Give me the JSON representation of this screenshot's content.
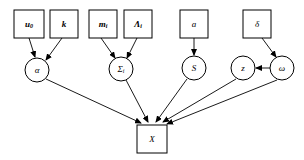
{
  "diagram": {
    "type": "directed-acyclic-graph",
    "background_color": "#ffffff",
    "stroke_color": "#000000",
    "node_fill": "#ffffff",
    "square_nodes": [
      {
        "id": "u0",
        "label": "u",
        "sub": "0",
        "bold": true,
        "x": 14,
        "y": 10,
        "w": 30,
        "h": 28
      },
      {
        "id": "k",
        "label": "k",
        "sub": "",
        "bold": true,
        "x": 50,
        "y": 10,
        "w": 28,
        "h": 28
      },
      {
        "id": "m_i",
        "label": "m",
        "sub": "i",
        "bold": true,
        "x": 89,
        "y": 10,
        "w": 28,
        "h": 28
      },
      {
        "id": "Lambda_i",
        "label": "Λ",
        "sub": "i",
        "bold": true,
        "x": 124,
        "y": 10,
        "w": 28,
        "h": 28
      },
      {
        "id": "a",
        "label": "a",
        "sub": "",
        "bold": false,
        "x": 180,
        "y": 10,
        "w": 28,
        "h": 28
      },
      {
        "id": "delta",
        "label": "δ",
        "sub": "",
        "bold": false,
        "x": 243,
        "y": 10,
        "w": 28,
        "h": 28
      },
      {
        "id": "X",
        "label": "X",
        "sub": "",
        "bold": false,
        "x": 137,
        "y": 125,
        "w": 30,
        "h": 28
      }
    ],
    "circle_nodes": [
      {
        "id": "alpha",
        "label": "α",
        "sub": "",
        "cx": 37,
        "cy": 70,
        "r": 12
      },
      {
        "id": "Sigma_i",
        "label": "Σ",
        "sub": "i",
        "cx": 121,
        "cy": 69,
        "r": 12
      },
      {
        "id": "S",
        "label": "S",
        "sub": "",
        "cx": 194,
        "cy": 68,
        "r": 12
      },
      {
        "id": "z",
        "label": "z",
        "sub": "",
        "cx": 243,
        "cy": 68,
        "r": 12
      },
      {
        "id": "omega",
        "label": "ω",
        "sub": "",
        "cx": 282,
        "cy": 68,
        "r": 12
      }
    ],
    "edges": [
      {
        "id": "u0-to-alpha",
        "from": "u0",
        "to": "alpha",
        "x1": 29,
        "y1": 38,
        "x2": 35,
        "y2": 57
      },
      {
        "id": "k-to-alpha",
        "from": "k",
        "to": "alpha",
        "x1": 62,
        "y1": 38,
        "x2": 46,
        "y2": 60
      },
      {
        "id": "mi-to-Sigma",
        "from": "m_i",
        "to": "Sigma_i",
        "x1": 101,
        "y1": 38,
        "x2": 115,
        "y2": 58
      },
      {
        "id": "Lambda-to-Sigma",
        "from": "Lambda_i",
        "to": "Sigma_i",
        "x1": 137,
        "y1": 38,
        "x2": 127,
        "y2": 58
      },
      {
        "id": "a-to-S",
        "from": "a",
        "to": "S",
        "x1": 194,
        "y1": 38,
        "x2": 194,
        "y2": 55
      },
      {
        "id": "delta-to-omega",
        "from": "delta",
        "to": "omega",
        "x1": 262,
        "y1": 38,
        "x2": 276,
        "y2": 57
      },
      {
        "id": "omega-to-z",
        "from": "omega",
        "to": "z",
        "x1": 270,
        "y1": 68,
        "x2": 256,
        "y2": 68
      },
      {
        "id": "alpha-to-X",
        "from": "alpha",
        "to": "X",
        "x1": 46,
        "y1": 79,
        "x2": 141,
        "y2": 123
      },
      {
        "id": "Sigma-to-X",
        "from": "Sigma_i",
        "to": "X",
        "x1": 126,
        "y1": 80,
        "x2": 148,
        "y2": 122
      },
      {
        "id": "S-to-X",
        "from": "S",
        "to": "X",
        "x1": 187,
        "y1": 79,
        "x2": 156,
        "y2": 122
      },
      {
        "id": "z-to-X",
        "from": "z",
        "to": "X",
        "x1": 236,
        "y1": 79,
        "x2": 163,
        "y2": 122
      },
      {
        "id": "omega-to-X",
        "from": "omega",
        "to": "X",
        "x1": 277,
        "y1": 80,
        "x2": 167,
        "y2": 124
      }
    ]
  }
}
